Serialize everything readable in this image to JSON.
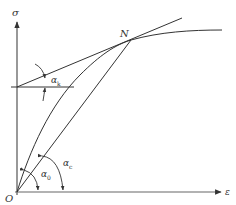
{
  "diagram": {
    "type": "stress-strain curve with modulus angles",
    "axes": {
      "y_label": "σ",
      "x_label": "ε",
      "origin_label": "O"
    },
    "points": {
      "N": {
        "label": "N"
      }
    },
    "angles": {
      "alpha_k": {
        "symbol": "α",
        "subscript": "k",
        "description": "angle of tangent line at N"
      },
      "alpha_0": {
        "symbol": "α",
        "subscript": "0",
        "description": "angle of initial tangent at origin"
      },
      "alpha_c": {
        "symbol": "α",
        "subscript": "c",
        "description": "angle of secant line from O to N"
      }
    },
    "lines": [
      {
        "name": "stress-strain-curve",
        "from": "O",
        "through": "N",
        "shape": "concave curve leveling off"
      },
      {
        "name": "tangent-line-at-N",
        "from": "horizontal reference",
        "through": "N"
      },
      {
        "name": "secant-line",
        "from": "O",
        "to": "N"
      },
      {
        "name": "horizontal-reference-line",
        "at": "tangent intercept on σ-axis"
      }
    ],
    "colors": {
      "stroke": "#333333",
      "background": "#ffffff"
    }
  }
}
